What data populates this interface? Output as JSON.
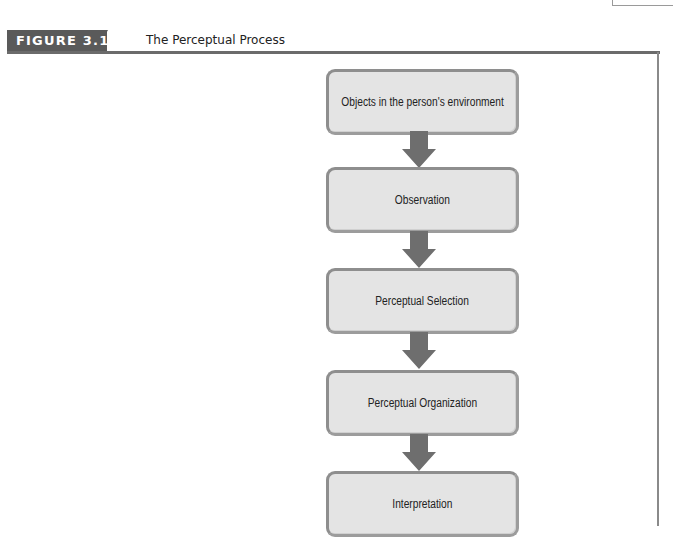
{
  "figure": {
    "label": "FIGURE 3.1",
    "title": "The Perceptual Process"
  },
  "flow": {
    "steps": [
      {
        "label": "Objects in the person's environment"
      },
      {
        "label": "Observation"
      },
      {
        "label": "Perceptual Selection"
      },
      {
        "label": "Perceptual Organization"
      },
      {
        "label": "Interpretation"
      }
    ],
    "arrow_color": "#6e6e6e",
    "box_fill": "#e4e4e4",
    "box_border": "#9c9c9c"
  }
}
